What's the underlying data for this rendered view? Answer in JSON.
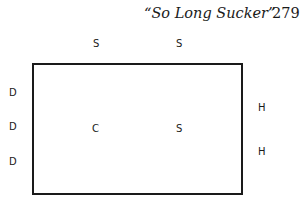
{
  "header": {
    "title": "“So Long Sucker”",
    "page_number": "279"
  },
  "diagram": {
    "top_labels": [
      {
        "text": "S",
        "x": 93,
        "y": 39
      },
      {
        "text": "S",
        "x": 176,
        "y": 39
      }
    ],
    "left_labels": [
      {
        "text": "D",
        "x": 9,
        "y": 88
      },
      {
        "text": "D",
        "x": 9,
        "y": 122
      },
      {
        "text": "D",
        "x": 9,
        "y": 157
      }
    ],
    "right_labels": [
      {
        "text": "H",
        "x": 258,
        "y": 103
      },
      {
        "text": "H",
        "x": 258,
        "y": 147
      }
    ],
    "center_labels": [
      {
        "text": "C",
        "x": 92,
        "y": 124
      },
      {
        "text": "S",
        "x": 176,
        "y": 124
      }
    ]
  }
}
